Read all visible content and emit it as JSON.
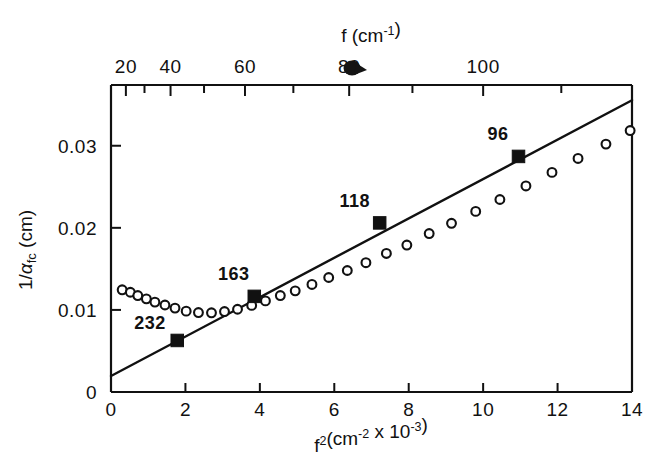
{
  "chart_data": {
    "type": "scatter",
    "title": "",
    "xlabel": "f²(cm⁻² x 10⁻³)",
    "ylabel": "1/α_fc (cm)",
    "top_axis_label": "f (cm⁻¹)",
    "xlim": [
      0,
      14
    ],
    "ylim": [
      0,
      0.0374
    ],
    "top_xlim_f": [
      0,
      118.3
    ],
    "grid": false,
    "legend": null,
    "xticks": [
      0,
      2,
      4,
      6,
      8,
      10,
      12,
      14
    ],
    "xticklabels": [
      "0",
      "2",
      "4",
      "6",
      "8",
      "10",
      "12",
      "14"
    ],
    "yticks": [
      0,
      0.01,
      0.02,
      0.03
    ],
    "yticklabels": [
      "0",
      "0.01",
      "0.02",
      "0.03"
    ],
    "top_ticks_f": [
      20,
      30,
      40,
      50,
      60,
      70,
      80,
      90,
      100,
      110
    ],
    "top_ticklabels": [
      {
        "f": 20,
        "text": "20"
      },
      {
        "f": 40,
        "text": "40"
      },
      {
        "f": 60,
        "text": "60"
      },
      {
        "f": 80,
        "text": "80"
      },
      {
        "f": 100,
        "text": "100"
      }
    ],
    "series": [
      {
        "name": "open-circles",
        "marker": "open circle",
        "points": [
          {
            "x": 0.3,
            "y": 0.01245
          },
          {
            "x": 0.52,
            "y": 0.01215
          },
          {
            "x": 0.72,
            "y": 0.01175
          },
          {
            "x": 0.95,
            "y": 0.01135
          },
          {
            "x": 1.18,
            "y": 0.01095
          },
          {
            "x": 1.45,
            "y": 0.0106
          },
          {
            "x": 1.72,
            "y": 0.01022
          },
          {
            "x": 2.02,
            "y": 0.00985
          },
          {
            "x": 2.35,
            "y": 0.00968
          },
          {
            "x": 2.7,
            "y": 0.00965
          },
          {
            "x": 3.05,
            "y": 0.0098
          },
          {
            "x": 3.4,
            "y": 0.01008
          },
          {
            "x": 3.78,
            "y": 0.01055
          },
          {
            "x": 4.15,
            "y": 0.0111
          },
          {
            "x": 4.55,
            "y": 0.01175
          },
          {
            "x": 4.95,
            "y": 0.01232
          },
          {
            "x": 5.4,
            "y": 0.0131
          },
          {
            "x": 5.85,
            "y": 0.01395
          },
          {
            "x": 6.35,
            "y": 0.0148
          },
          {
            "x": 6.85,
            "y": 0.01575
          },
          {
            "x": 7.4,
            "y": 0.01688
          },
          {
            "x": 7.95,
            "y": 0.0179
          },
          {
            "x": 8.55,
            "y": 0.0193
          },
          {
            "x": 9.15,
            "y": 0.02055
          },
          {
            "x": 9.8,
            "y": 0.022
          },
          {
            "x": 10.45,
            "y": 0.02345
          },
          {
            "x": 11.15,
            "y": 0.0251
          },
          {
            "x": 11.85,
            "y": 0.02675
          },
          {
            "x": 12.55,
            "y": 0.02845
          },
          {
            "x": 13.3,
            "y": 0.0302
          },
          {
            "x": 13.95,
            "y": 0.03185
          }
        ]
      },
      {
        "name": "filled-squares",
        "marker": "filled square",
        "points": [
          {
            "x": 1.78,
            "y": 0.00628,
            "label": "232"
          },
          {
            "x": 3.85,
            "y": 0.01165,
            "label": "163"
          },
          {
            "x": 7.22,
            "y": 0.0206,
            "label": "118"
          },
          {
            "x": 10.95,
            "y": 0.0287,
            "label": "96"
          }
        ]
      }
    ],
    "fit_line": {
      "name": "linear fit",
      "x": [
        0,
        14
      ],
      "y": [
        0.00195,
        0.03555
      ],
      "intercept": 0.00195,
      "slope_per_unit": 0.0024
    },
    "annotations": [
      {
        "text": "232",
        "x": 1.05,
        "y": 0.0077
      },
      {
        "text": "163",
        "x": 3.3,
        "y": 0.01365
      },
      {
        "text": "118",
        "x": 6.55,
        "y": 0.02255
      },
      {
        "text": "96",
        "x": 10.4,
        "y": 0.03075
      }
    ],
    "colors": {
      "ink": "#111111",
      "background": "#ffffff",
      "marker_face": "#ffffff"
    }
  }
}
